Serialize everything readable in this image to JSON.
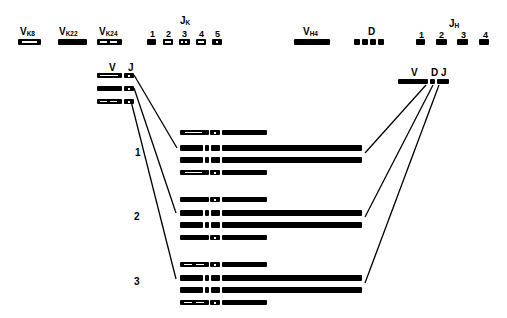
{
  "germline": {
    "kappa_v": [
      {
        "name": "V",
        "sub": "K8",
        "pattern": "long-stripe"
      },
      {
        "name": "V",
        "sub": "K22",
        "pattern": "solid"
      },
      {
        "name": "V",
        "sub": "K24",
        "pattern": "dashed"
      }
    ],
    "kappa_j": {
      "name": "J",
      "sub": "K",
      "segments": [
        {
          "label": "1",
          "pattern": "solid"
        },
        {
          "label": "2",
          "pattern": "stripe"
        },
        {
          "label": "3",
          "pattern": "two-dots"
        },
        {
          "label": "4",
          "pattern": "wave"
        },
        {
          "label": "5",
          "pattern": "dot"
        }
      ]
    },
    "heavy_v": {
      "name": "V",
      "sub": "H4"
    },
    "heavy_d": {
      "name": "D",
      "count": 4
    },
    "heavy_j": {
      "name": "J",
      "sub": "H",
      "segments": [
        {
          "label": "1"
        },
        {
          "label": "2"
        },
        {
          "label": "3"
        },
        {
          "label": "4"
        }
      ]
    }
  },
  "rearranged": {
    "light": {
      "v_label": "V",
      "j_label": "J",
      "rows": 3
    },
    "heavy": {
      "v_label": "V",
      "d_label": "D",
      "j_label": "J"
    }
  },
  "groups": [
    {
      "label": "1",
      "light_pattern": "long-stripe"
    },
    {
      "label": "2",
      "light_pattern": "solid"
    },
    {
      "label": "3",
      "light_pattern": "dashed"
    }
  ]
}
